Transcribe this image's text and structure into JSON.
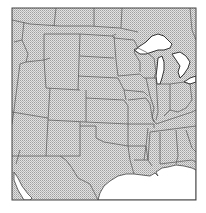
{
  "map": {
    "description": "Outline map of the central United States with stippled land fill",
    "colors": {
      "background": "#ffffff",
      "land_fill": "#d9d9d9",
      "stipple_dot": "#9a9a9a",
      "border": "#555555",
      "frame": "#444444",
      "water": "#ffffff"
    },
    "frame": {
      "x": 12,
      "y": 8,
      "width": 184,
      "height": 192
    },
    "regions": [
      "Montana",
      "Wyoming",
      "Colorado",
      "New Mexico",
      "North Dakota",
      "South Dakota",
      "Nebraska",
      "Kansas",
      "Oklahoma",
      "Texas",
      "Minnesota",
      "Iowa",
      "Missouri",
      "Arkansas",
      "Louisiana",
      "Wisconsin",
      "Illinois",
      "Michigan",
      "Indiana",
      "Ohio",
      "Kentucky",
      "Tennessee",
      "Mississippi",
      "Alabama",
      "Georgia",
      "Idaho",
      "Utah",
      "Arizona",
      "Nevada"
    ],
    "water_bodies": [
      "Lake Superior",
      "Lake Michigan",
      "Lake Huron",
      "Lake Erie",
      "Gulf of Mexico"
    ]
  }
}
